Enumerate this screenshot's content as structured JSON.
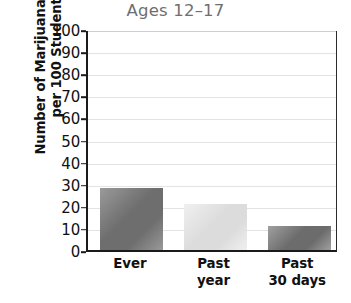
{
  "chart_data": {
    "type": "bar",
    "title": "Ages 12–17",
    "xlabel": "",
    "ylabel": "Number of Marijuana Users per 100 Students",
    "ylabel_lines": [
      "Number of Marijuana Users",
      "per 100 Students"
    ],
    "categories": [
      "Ever",
      "Past year",
      "Past 30 days"
    ],
    "category_lines": [
      [
        "Ever"
      ],
      [
        "Past",
        "year"
      ],
      [
        "Past",
        "30 days"
      ]
    ],
    "values": [
      28,
      21,
      11
    ],
    "ylim": [
      0,
      100
    ],
    "ytick_values": [
      0,
      10,
      20,
      30,
      40,
      50,
      60,
      70,
      80,
      90,
      100
    ],
    "ytick_labels": [
      "0",
      "10",
      "20",
      "30",
      "40",
      "50",
      "60",
      "70",
      "80",
      "90",
      "100"
    ],
    "grid": true,
    "legend": "none",
    "bar_colors": [
      "#7c7c7c",
      "#e2e2e2",
      "#7f7f7f"
    ],
    "bars": [
      {
        "category": "Ever",
        "value": 28,
        "color_light": "#9a9a9a",
        "color_dark": "#6e6e6e"
      },
      {
        "category": "Past year",
        "value": 21,
        "color_light": "#f0f0f0",
        "color_dark": "#dcdcdc"
      },
      {
        "category": "Past 30 days",
        "value": 11,
        "color_light": "#a0a0a0",
        "color_dark": "#6c6c6c"
      }
    ]
  },
  "colors": {
    "title": "#6f6f6f",
    "axis": "#1a1a1a",
    "grid": "#e3e3e3",
    "text": "#111111",
    "background": "#ffffff"
  }
}
